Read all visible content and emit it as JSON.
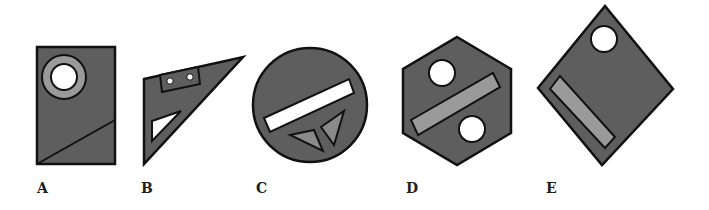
{
  "colors": {
    "shape_fill": "#5e5e5e",
    "inner_fill": "#9a9a9a",
    "hole_fill": "#ffffff",
    "stroke": "#111111",
    "label": "#1e1e1e"
  },
  "figures": [
    {
      "label": "A",
      "shape": "rectangle",
      "features": [
        "ring (light gray annulus with white center)",
        "diagonal line"
      ]
    },
    {
      "label": "B",
      "shape": "right triangle (set square)",
      "features": [
        "small rectangle with two white dots",
        "white triangular cutout"
      ]
    },
    {
      "label": "C",
      "shape": "circle",
      "features": [
        "white rotated bar",
        "two gray triangles"
      ]
    },
    {
      "label": "D",
      "shape": "hexagon",
      "features": [
        "two white circles",
        "gray rotated bar"
      ]
    },
    {
      "label": "E",
      "shape": "diamond (rotated square)",
      "features": [
        "white circle",
        "gray rotated bar"
      ]
    }
  ],
  "labels": [
    "A",
    "B",
    "C",
    "D",
    "E"
  ]
}
